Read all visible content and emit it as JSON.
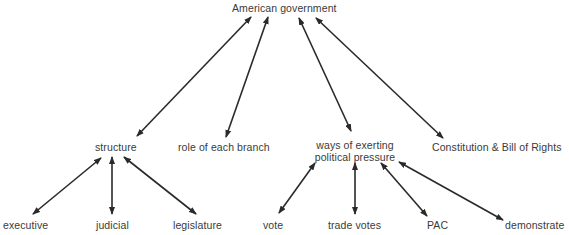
{
  "diagram": {
    "type": "concept-map",
    "root": {
      "id": "american-government",
      "label": "American government"
    },
    "level1": [
      {
        "id": "structure",
        "label": "structure"
      },
      {
        "id": "role-of-each-branch",
        "label": "role of each branch"
      },
      {
        "id": "ways-of-exerting",
        "label_line1": "ways of exerting",
        "label_line2": "political pressure"
      },
      {
        "id": "constitution",
        "label": "Constitution & Bill of Rights"
      }
    ],
    "level2_structure": [
      {
        "id": "executive",
        "label": "executive"
      },
      {
        "id": "judicial",
        "label": "judicial"
      },
      {
        "id": "legislature",
        "label": "legislature"
      }
    ],
    "level2_pressure": [
      {
        "id": "vote",
        "label": "vote"
      },
      {
        "id": "trade-votes",
        "label": "trade votes"
      },
      {
        "id": "pac",
        "label": "PAC"
      },
      {
        "id": "demonstrate",
        "label": "demonstrate"
      }
    ],
    "edges": [
      {
        "from": "american-government",
        "to": "structure",
        "direction": "both"
      },
      {
        "from": "american-government",
        "to": "role-of-each-branch",
        "direction": "both"
      },
      {
        "from": "american-government",
        "to": "ways-of-exerting",
        "direction": "both"
      },
      {
        "from": "american-government",
        "to": "constitution",
        "direction": "both"
      },
      {
        "from": "structure",
        "to": "executive",
        "direction": "both"
      },
      {
        "from": "structure",
        "to": "judicial",
        "direction": "both"
      },
      {
        "from": "structure",
        "to": "legislature",
        "direction": "both"
      },
      {
        "from": "ways-of-exerting",
        "to": "vote",
        "direction": "both"
      },
      {
        "from": "ways-of-exerting",
        "to": "trade-votes",
        "direction": "both"
      },
      {
        "from": "ways-of-exerting",
        "to": "pac",
        "direction": "both"
      },
      {
        "from": "ways-of-exerting",
        "to": "demonstrate",
        "direction": "both"
      }
    ],
    "colors": {
      "text": "#3a3a3a",
      "arrow": "#2a2a2a",
      "background": "#ffffff"
    }
  }
}
